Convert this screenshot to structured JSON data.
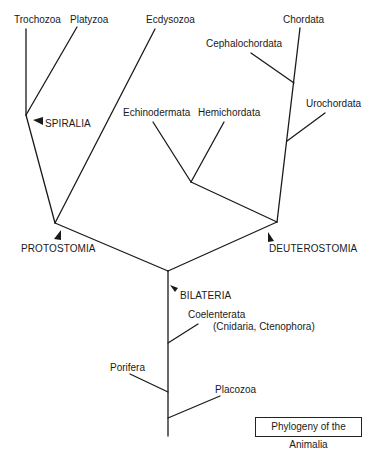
{
  "title": "Phylogeny of the Animalia",
  "taxa": {
    "trochozoa": "Trochozoa",
    "platyzoa": "Platyzoa",
    "ecdysozoa": "Ecdysozoa",
    "chordata": "Chordata",
    "cephalochordata": "Cephalochordata",
    "urochordata": "Urochordata",
    "echinodermata": "Echinodermata",
    "hemichordata": "Hemichordata",
    "coelenterata": "Coelenterata",
    "coelenterata_sub": "(Cnidaria, Ctenophora)",
    "porifera": "Porifera",
    "placozoa": "Placozoa"
  },
  "clades": {
    "spiralia": "SPIRALIA",
    "protostomia": "PROTOSTOMIA",
    "deuterostomia": "DEUTEROSTOMIA",
    "bilateria": "BILATERIA"
  },
  "colors": {
    "line": "#1a1a1a",
    "background": "#ffffff"
  }
}
